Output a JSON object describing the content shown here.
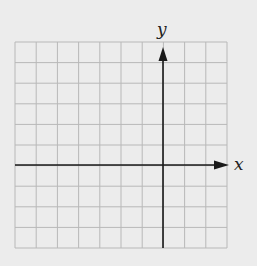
{
  "diagram": {
    "type": "coordinate-grid",
    "grid": {
      "columns": 10,
      "rows": 10,
      "origin_column": 7,
      "origin_row": 6
    },
    "axes": {
      "x_label": "x",
      "y_label": "y"
    },
    "colors": {
      "background": "#ececec",
      "grid": "#b8b8b8",
      "axis": "#1a1a1a"
    }
  }
}
